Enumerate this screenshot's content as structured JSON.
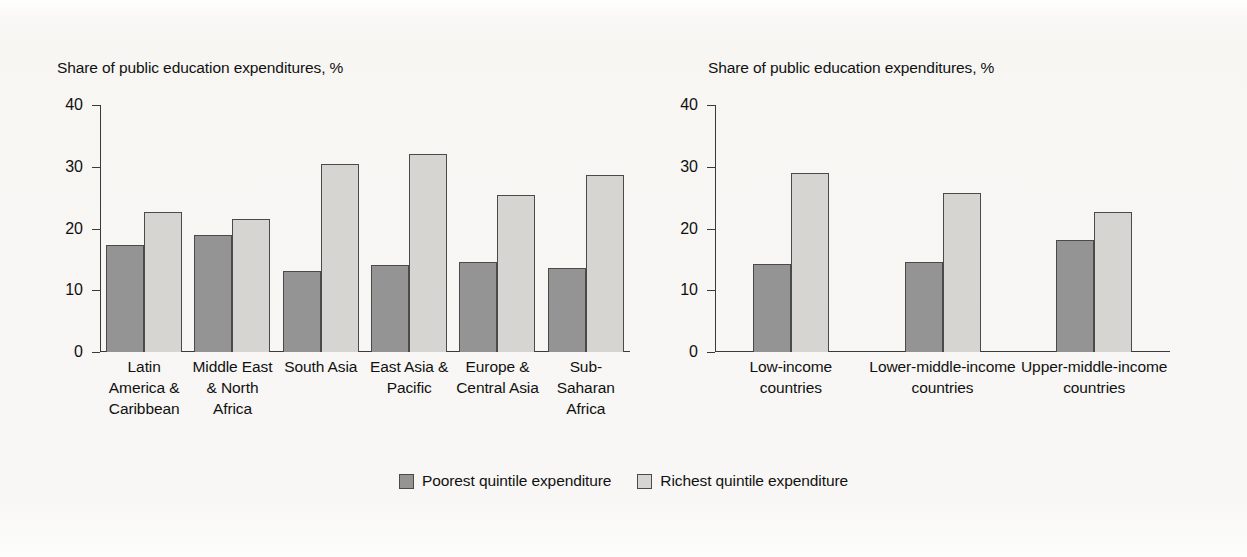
{
  "figure": {
    "background_color": "#f8f7f5",
    "poorest_color": "#949494",
    "richest_color": "#d6d5d2",
    "outline_color": "#4a4a4a"
  },
  "legend": {
    "items": [
      {
        "label": "Poorest quintile expenditure",
        "swatch": "poorest"
      },
      {
        "label": "Richest quintile expenditure",
        "swatch": "richest"
      }
    ]
  },
  "chart_data": [
    {
      "type": "bar",
      "title": "",
      "ylabel": "Share of public education expenditures, %",
      "xlabel": "",
      "ylim": [
        0,
        40
      ],
      "yticks": [
        0,
        10,
        20,
        30,
        40
      ],
      "grid": false,
      "legend_position": "bottom-center",
      "categories": [
        "Latin America & Caribbean",
        "Middle East & North Africa",
        "South Asia",
        "East Asia & Pacific",
        "Europe & Central Asia",
        "Sub-Saharan Africa"
      ],
      "series": [
        {
          "name": "Poorest quintile expenditure",
          "values": [
            17.4,
            19.0,
            13.1,
            14.1,
            14.5,
            13.6
          ]
        },
        {
          "name": "Richest quintile expenditure",
          "values": [
            22.6,
            21.5,
            30.5,
            32.0,
            25.5,
            28.6
          ]
        }
      ]
    },
    {
      "type": "bar",
      "title": "",
      "ylabel": "Share of public education expenditures, %",
      "xlabel": "",
      "ylim": [
        0,
        40
      ],
      "yticks": [
        0,
        10,
        20,
        30,
        40
      ],
      "grid": false,
      "legend_position": "bottom-center",
      "categories": [
        "Low-income countries",
        "Lower-middle-income countries",
        "Upper-middle-income countries"
      ],
      "series": [
        {
          "name": "Poorest quintile expenditure",
          "values": [
            14.2,
            14.6,
            18.2
          ]
        },
        {
          "name": "Richest quintile expenditure",
          "values": [
            29.0,
            25.8,
            22.7
          ]
        }
      ]
    }
  ]
}
